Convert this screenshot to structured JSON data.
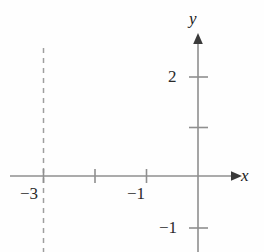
{
  "figure": {
    "name": "logarithmic-function-graph",
    "background_color": "#fefefe",
    "curve_color": "#000000",
    "axis_color": "#8a8a8a",
    "asymptote_color": "#9a9a9a"
  },
  "axes": {
    "x_label": "x",
    "y_label": "y",
    "x_arrow": true,
    "y_arrow": true
  },
  "ticks": {
    "x": [
      {
        "value": -3,
        "label": "−3"
      },
      {
        "value": -2,
        "label": ""
      },
      {
        "value": -1,
        "label": "−1"
      }
    ],
    "y": [
      {
        "value": 2,
        "label": "2"
      },
      {
        "value": 1,
        "label": ""
      },
      {
        "value": -1,
        "label": "−1"
      }
    ]
  },
  "asymptote": {
    "type": "vertical",
    "x": -3,
    "style": "dashed",
    "label": ""
  },
  "chart_data": {
    "type": "line",
    "title": "",
    "xlabel": "x",
    "ylabel": "y",
    "xlim": [
      -3.6,
      0.65
    ],
    "ylim": [
      -1.6,
      2.6
    ],
    "grid": false,
    "legend": null,
    "annotations": [
      {
        "text": "vertical asymptote at x = −3",
        "x": -3,
        "y": 0
      },
      {
        "text": "x-intercept at (−2, 0)",
        "x": -2,
        "y": 0
      }
    ],
    "series": [
      {
        "name": "y = ln(x + 3)",
        "x": [
          -2.96,
          -2.92,
          -2.88,
          -2.82,
          -2.75,
          -2.65,
          -2.55,
          -2.45,
          -2.35,
          -2.2,
          -2.0,
          -1.8,
          -1.6,
          -1.4,
          -1.2,
          -1.0,
          -0.7,
          -0.4,
          -0.1,
          0.2,
          0.5
        ],
        "y": [
          -3.22,
          -2.53,
          -2.12,
          -1.71,
          -1.39,
          -1.06,
          -0.81,
          -0.6,
          -0.42,
          -0.22,
          0.0,
          0.18,
          0.34,
          0.47,
          0.59,
          0.69,
          0.83,
          0.96,
          1.06,
          1.16,
          1.25
        ]
      }
    ],
    "x_ticks": [
      -3,
      -2,
      -1
    ],
    "x_tick_labels": [
      "−3",
      "",
      "−1"
    ],
    "y_ticks": [
      -1,
      1,
      2
    ],
    "y_tick_labels": [
      "−1",
      "",
      "2"
    ]
  }
}
